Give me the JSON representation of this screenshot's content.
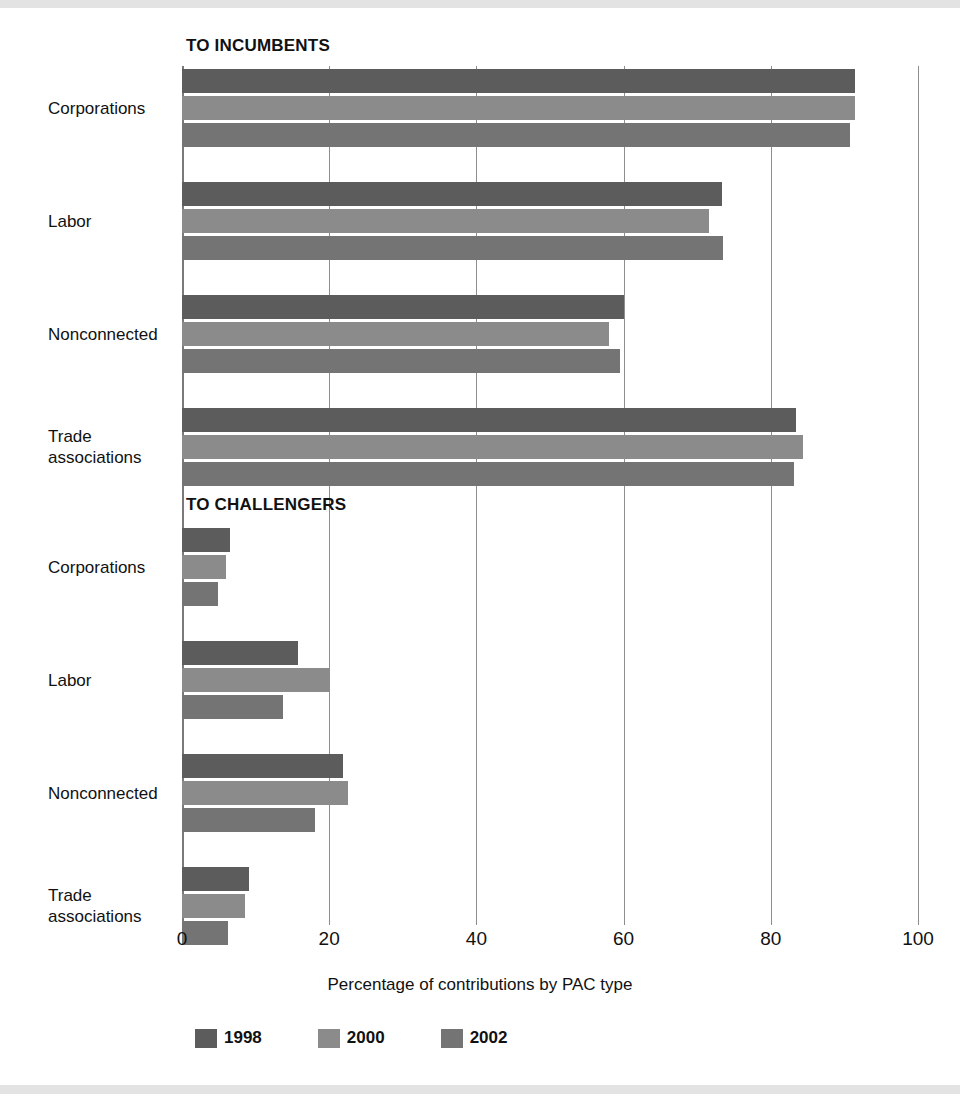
{
  "chart_data": {
    "type": "bar",
    "orientation": "horizontal",
    "title": "",
    "xlabel": "Percentage of contributions by PAC type",
    "ylabel": "",
    "xlim": [
      0,
      100
    ],
    "xticks": [
      0,
      20,
      40,
      60,
      80,
      100
    ],
    "xtick_labels": [
      "0",
      "20",
      "40",
      "60",
      "80",
      "100"
    ],
    "grid": true,
    "grid_axis": "x",
    "legend": {
      "position": "bottom",
      "entries": [
        {
          "name": "1998",
          "color": "#5c5c5c"
        },
        {
          "name": "2000",
          "color": "#8b8b8b"
        },
        {
          "name": "2002",
          "color": "#747474"
        }
      ]
    },
    "panels": [
      {
        "title": "TO INCUMBENTS",
        "categories": [
          "Corporations",
          "Labor",
          "Nonconnected",
          "Trade\nassociations"
        ],
        "series": [
          {
            "name": "1998",
            "color": "#5c5c5c",
            "values": [
              91.5,
              73.4,
              60.0,
              83.4
            ]
          },
          {
            "name": "2000",
            "color": "#8b8b8b",
            "values": [
              91.5,
              71.6,
              58.0,
              84.4
            ]
          },
          {
            "name": "2002",
            "color": "#747474",
            "values": [
              90.7,
              73.5,
              59.5,
              83.2
            ]
          }
        ]
      },
      {
        "title": "TO CHALLENGERS",
        "categories": [
          "Corporations",
          "Labor",
          "Nonconnected",
          "Trade\nassociations"
        ],
        "series": [
          {
            "name": "1998",
            "color": "#5c5c5c",
            "values": [
              6.5,
              15.8,
              21.9,
              9.1
            ]
          },
          {
            "name": "2000",
            "color": "#8b8b8b",
            "values": [
              6.0,
              20.1,
              22.6,
              8.6
            ]
          },
          {
            "name": "2002",
            "color": "#747474",
            "values": [
              4.9,
              13.7,
              18.1,
              6.3
            ]
          }
        ]
      }
    ]
  }
}
